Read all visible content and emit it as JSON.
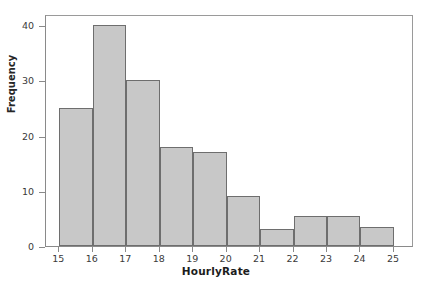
{
  "chart_data": {
    "type": "bar",
    "title": "",
    "xlabel": "HourlyRate",
    "ylabel": "Frequency",
    "categories": [
      "15-16",
      "16-17",
      "17-18",
      "18-19",
      "19-20",
      "20-21",
      "21-22",
      "22-23",
      "23-24",
      "24-25"
    ],
    "bin_edges": [
      15,
      16,
      17,
      18,
      19,
      20,
      21,
      22,
      23,
      24,
      25
    ],
    "values": [
      25,
      40,
      30,
      18,
      17,
      9,
      3,
      5.5,
      5.5,
      3.5
    ],
    "xlim": [
      14.6,
      25.6
    ],
    "ylim": [
      0,
      42
    ],
    "x_ticks": [
      15,
      16,
      17,
      18,
      19,
      20,
      21,
      22,
      23,
      24,
      25
    ],
    "x_tick_labels": [
      "15",
      "16",
      "17",
      "18",
      "19",
      "20",
      "21",
      "22",
      "23",
      "24",
      "25"
    ],
    "y_ticks": [
      0,
      10,
      20,
      30,
      40
    ],
    "y_tick_labels": [
      "0",
      "10",
      "20",
      "30",
      "40"
    ],
    "grid": false,
    "legend": false,
    "bar_fill_color": "#c8c8c8",
    "bar_edge_color": "#6e6e6e",
    "axis_color": "#8a8a8a",
    "text_color": "#3a3a3a"
  },
  "figure": {
    "title_remnant": "",
    "background_color": "#ffffff"
  }
}
